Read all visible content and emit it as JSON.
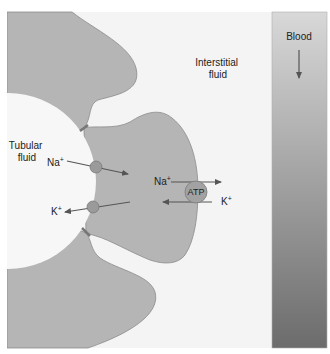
{
  "labels": {
    "tubular_fluid_line1": "Tubular",
    "tubular_fluid_line2": "fluid",
    "interstitial_line1": "Interstitial",
    "interstitial_line2": "fluid",
    "blood": "Blood",
    "na_apical": "Na",
    "k_apical": "K",
    "na_basolateral": "Na",
    "k_basolateral": "K",
    "plus": "+",
    "pump": "ATP"
  },
  "colors": {
    "background": "#f4f4f4",
    "cell_fill": "#b5b5b5",
    "cell_stroke": "#8a8a8a",
    "tubular_fluid": "#f7f7f7",
    "blood_top": "#d6d6d6",
    "blood_bottom": "#6e6e6e",
    "arrow": "#555555",
    "channel_fill": "#9a9a9a",
    "pump_fill": "#a2a2a2"
  }
}
